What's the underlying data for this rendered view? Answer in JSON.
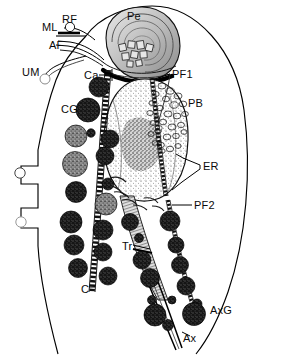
{
  "figure": {
    "background_color": "#ffffff",
    "ink_color": "#000000",
    "width": 282,
    "height": 357
  },
  "labels": [
    {
      "id": "ML",
      "text": "ML",
      "x": 42,
      "y": 22,
      "name": "label-ml-mastigont-lamella"
    },
    {
      "id": "RF",
      "text": "RF",
      "x": 62,
      "y": 14,
      "name": "label-rf-recurrent-flagellum"
    },
    {
      "id": "AF",
      "text": "AF",
      "x": 49,
      "y": 40,
      "name": "label-af-anterior-flagellum"
    },
    {
      "id": "UM",
      "text": "UM",
      "x": 22,
      "y": 67,
      "name": "label-um-undulating-membrane"
    },
    {
      "id": "Pe",
      "text": "Pe",
      "x": 127,
      "y": 11,
      "name": "label-pe-pelta"
    },
    {
      "id": "Ca",
      "text": "Ca",
      "x": 84,
      "y": 70,
      "name": "label-ca-capitulum"
    },
    {
      "id": "CG",
      "text": "CG",
      "x": 61,
      "y": 104,
      "name": "label-cg-cytoplasmic-granules"
    },
    {
      "id": "PF1",
      "text": "PF1",
      "x": 172,
      "y": 69,
      "name": "label-pf1-parabasal-filament-1"
    },
    {
      "id": "PB",
      "text": "PB",
      "x": 188,
      "y": 98,
      "name": "label-pb-parabasal-body"
    },
    {
      "id": "ER",
      "text": "ER",
      "x": 203,
      "y": 161,
      "name": "label-er-endoplasmic-reticulum"
    },
    {
      "id": "PF2",
      "text": "PF2",
      "x": 194,
      "y": 200,
      "name": "label-pf2-parabasal-filament-2"
    },
    {
      "id": "Tr",
      "text": "Tr",
      "x": 122,
      "y": 241,
      "name": "label-tr-trunk"
    },
    {
      "id": "C",
      "text": "C",
      "x": 81,
      "y": 284,
      "name": "label-c-costa"
    },
    {
      "id": "AxG",
      "text": "AxG",
      "x": 210,
      "y": 305,
      "name": "label-axg-axostylar-granules"
    },
    {
      "id": "Ax",
      "text": "Ax",
      "x": 183,
      "y": 333,
      "name": "label-ax-axostyle"
    }
  ],
  "legend_keys": {
    "ML": "Mastigont lamella",
    "RF": "Recurrent flagellum",
    "AF": "Anterior flagella",
    "UM": "Undulating membrane",
    "Pe": "Pelta",
    "Ca": "Capitulum",
    "CG": "Cytoplasmic granules",
    "PF1": "Parabasal filament 1",
    "PB": "Parabasal body",
    "ER": "Endoplasmic reticulum",
    "PF2": "Parabasal filament 2",
    "Tr": "Trunk",
    "C": "Costa",
    "AxG": "Axostylar granules",
    "Ax": "Axostyle"
  },
  "structures": {
    "cell_outline": "pear-shaped cell body outline",
    "nucleus": "large stippled ovoid nucleus",
    "pelta": "coiled shell-like apical structure",
    "costa": "striated ladder-like rod running from capitulum to lower left",
    "axostyle": "tapering rod exiting posterior end of cell",
    "granule_count": 41
  }
}
